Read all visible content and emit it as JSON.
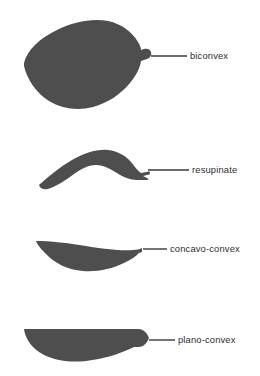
{
  "figure": {
    "background_color": "#ffffff",
    "shape_fill_color": "#4e4e4e",
    "label_text_color": "#2e2e2e",
    "leader_line_color": "#3a3a3a",
    "items": [
      {
        "id": "biconvex",
        "label": "biconvex",
        "label_x": 190,
        "label_y": 51,
        "leader": {
          "x1": 151,
          "y1": 56,
          "x2": 187,
          "y2": 56
        },
        "shape_name": "biconvex-shell-shape"
      },
      {
        "id": "resupinate",
        "label": "resupinate",
        "label_x": 192,
        "label_y": 165,
        "leader": {
          "x1": 148,
          "y1": 170,
          "x2": 189,
          "y2": 170
        },
        "shape_name": "resupinate-shell-shape"
      },
      {
        "id": "concavo-convex",
        "label": "concavo-convex",
        "label_x": 170,
        "label_y": 244,
        "leader": {
          "x1": 143,
          "y1": 249,
          "x2": 167,
          "y2": 249
        },
        "shape_name": "concavo-convex-shell-shape"
      },
      {
        "id": "plano-convex",
        "label": "plano-convex",
        "label_x": 178,
        "label_y": 335,
        "leader": {
          "x1": 149,
          "y1": 340,
          "x2": 175,
          "y2": 340
        },
        "shape_name": "plano-convex-shell-shape"
      }
    ]
  }
}
